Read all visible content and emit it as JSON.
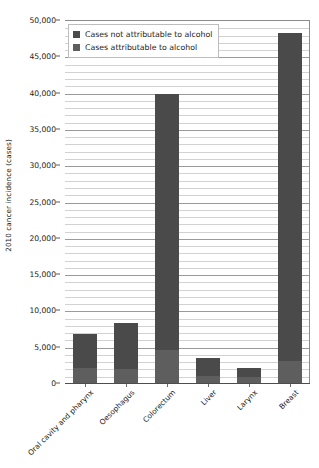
{
  "chart_data": {
    "type": "bar",
    "subtype": "stacked",
    "title": "",
    "xlabel": "",
    "ylabel": "2010 cancer incidence (cases)",
    "ylim": [
      0,
      50000
    ],
    "ytick_step": 5000,
    "yminor_step": 1000,
    "grid": true,
    "legend_position": "top-left",
    "categories": [
      "Oral cavity and pharynx",
      "Oesophagus",
      "Colorectum",
      "Liver",
      "Larynx",
      "Breast"
    ],
    "ytick_labels": [
      "0",
      "5,000",
      "10,000",
      "15,000",
      "20,000",
      "25,000",
      "30,000",
      "35,000",
      "40,000",
      "45,000",
      "50,000"
    ],
    "ytick_values": [
      0,
      5000,
      10000,
      15000,
      20000,
      25000,
      30000,
      35000,
      40000,
      45000,
      50000
    ],
    "series": [
      {
        "name": "Cases not attributable to alcohol",
        "color": "#4a4a4a",
        "values": [
          4700,
          6400,
          35200,
          2600,
          1300,
          45100
        ]
      },
      {
        "name": "Cases attributable to alcohol",
        "color": "#5e5e5e",
        "values": [
          2100,
          1900,
          4600,
          900,
          800,
          3100
        ]
      }
    ],
    "totals": [
      6800,
      8300,
      39800,
      3500,
      2100,
      48200
    ]
  },
  "legend": {
    "items": [
      {
        "label": "Cases not attributable to alcohol",
        "color": "#4a4a4a"
      },
      {
        "label": "Cases attributable to alcohol",
        "color": "#5e5e5e"
      }
    ]
  }
}
